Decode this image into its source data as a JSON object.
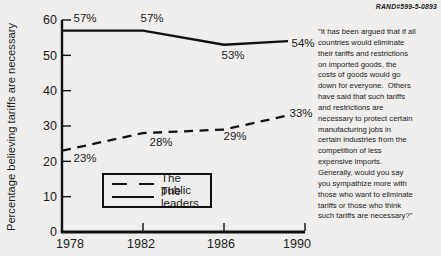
{
  "meta": {
    "doc_id": "RAND#599-5-0893"
  },
  "question": {
    "text": "\"It has been argued that if all\ncountries would eliminate\ntheir tariffs and restrictions\non imported goods, the\ncosts of goods would go\ndown for everyone.  Others\nhave said that such tariffs\nand restrictions are\nnecessary to protect certain\nmanufacturing jobs in\ncertain industries from the\ncompetition of less\nexpensive imports.\nGenerally, would you say\nyou sympathize more with\nthose who want to eliminate\ntariffs or those who think\nsuch tariffs are necessary?\""
  },
  "chart_data": {
    "type": "line",
    "title": "",
    "xlabel": "",
    "ylabel": "Percentage believing tariffs are necessary",
    "x": [
      1978,
      1982,
      1986,
      1990
    ],
    "x_tick_labels": [
      "1978",
      "1982",
      "1986",
      "1990"
    ],
    "y_ticks": [
      0,
      10,
      20,
      30,
      40,
      50,
      60
    ],
    "ylim": [
      0,
      60
    ],
    "grid": false,
    "legend_position": "inside-bottom-left",
    "series": [
      {
        "name": "The public",
        "style": "dashed",
        "values": [
          23,
          28,
          29,
          33
        ],
        "point_labels": [
          "23%",
          "28%",
          "29%",
          "33%"
        ]
      },
      {
        "name": "The leaders",
        "style": "solid",
        "values": [
          57,
          57,
          53,
          54
        ],
        "point_labels": [
          "57%",
          "57%",
          "53%",
          "54%"
        ]
      }
    ],
    "colors": {
      "line": "#111111",
      "text": "#1a1a1a",
      "background": "#efeeec"
    }
  }
}
